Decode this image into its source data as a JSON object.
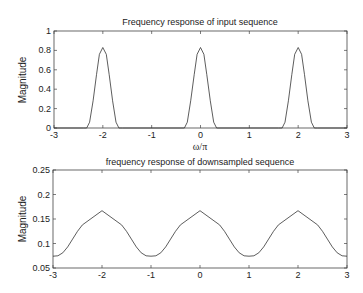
{
  "chart_data": [
    {
      "type": "line",
      "title": "Frequency response of input sequence",
      "xlabel": "ω/π",
      "ylabel": "Magnitude",
      "xlim": [
        -3,
        3
      ],
      "ylim": [
        0,
        1
      ],
      "xticks": [
        -3,
        -2,
        -1,
        0,
        1,
        2,
        3
      ],
      "yticks": [
        0,
        0.2,
        0.4,
        0.6,
        0.8,
        1
      ],
      "ytick_labels": [
        "0",
        "0.2",
        "0.4",
        "0.6",
        "0.8",
        "1"
      ],
      "grid": false,
      "series": [
        {
          "name": "input",
          "x": [
            -3,
            -2.4,
            -2.33,
            -2.27,
            -2.2,
            -2.13,
            -2.07,
            -2.0,
            -1.93,
            -1.87,
            -1.8,
            -1.73,
            -1.67,
            -1.6,
            -0.4,
            -0.33,
            -0.27,
            -0.2,
            -0.13,
            -0.07,
            0.0,
            0.07,
            0.13,
            0.2,
            0.27,
            0.33,
            0.4,
            1.6,
            1.67,
            1.73,
            1.8,
            1.87,
            1.93,
            2.0,
            2.07,
            2.13,
            2.2,
            2.27,
            2.33,
            2.4,
            3
          ],
          "y": [
            0,
            0,
            0,
            0.06,
            0.28,
            0.55,
            0.76,
            0.83,
            0.76,
            0.55,
            0.28,
            0.06,
            0,
            0,
            0,
            0,
            0.06,
            0.28,
            0.55,
            0.76,
            0.83,
            0.76,
            0.55,
            0.28,
            0.06,
            0,
            0,
            0,
            0,
            0.06,
            0.28,
            0.55,
            0.76,
            0.83,
            0.76,
            0.55,
            0.28,
            0.06,
            0,
            0,
            0
          ]
        }
      ]
    },
    {
      "type": "line",
      "title": "frequency response of downsampled  sequence",
      "xlabel": "",
      "ylabel": "Magnitude",
      "xlim": [
        -3,
        3
      ],
      "ylim": [
        0.05,
        0.25
      ],
      "xticks": [
        -3,
        -2,
        -1,
        0,
        1,
        2,
        3
      ],
      "yticks": [
        0.05,
        0.1,
        0.15,
        0.2,
        0.25
      ],
      "ytick_labels": [
        "0.05",
        "0.1",
        "0.15",
        "0.2",
        "0.25"
      ],
      "grid": false,
      "series": [
        {
          "name": "downsampled",
          "x": [
            -3,
            -2.9,
            -2.8,
            -2.7,
            -2.6,
            -2.5,
            -2.4,
            -2.0,
            -1.6,
            -1.5,
            -1.4,
            -1.3,
            -1.2,
            -1.1,
            -1.0,
            -0.9,
            -0.8,
            -0.7,
            -0.6,
            -0.5,
            -0.4,
            0.0,
            0.4,
            0.5,
            0.6,
            0.7,
            0.8,
            0.9,
            1.0,
            1.1,
            1.2,
            1.3,
            1.4,
            1.5,
            1.6,
            2.0,
            2.4,
            2.5,
            2.6,
            2.7,
            2.8,
            2.9,
            3.0
          ],
          "y": [
            0.074,
            0.075,
            0.081,
            0.093,
            0.109,
            0.125,
            0.138,
            0.167,
            0.138,
            0.125,
            0.109,
            0.093,
            0.081,
            0.075,
            0.074,
            0.075,
            0.081,
            0.093,
            0.109,
            0.125,
            0.138,
            0.167,
            0.138,
            0.125,
            0.109,
            0.093,
            0.081,
            0.075,
            0.074,
            0.075,
            0.081,
            0.093,
            0.109,
            0.125,
            0.138,
            0.167,
            0.138,
            0.125,
            0.109,
            0.093,
            0.081,
            0.075,
            0.074
          ]
        }
      ]
    }
  ],
  "plots": [
    {
      "title": "Frequency response of input sequence",
      "ylabel": "Magnitude",
      "xlabel": "ω/π"
    },
    {
      "title": "frequency response of downsampled  sequence",
      "ylabel": "Magnitude",
      "xlabel": ""
    }
  ]
}
